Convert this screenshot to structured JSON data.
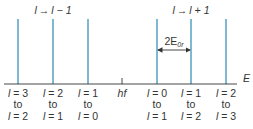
{
  "diagram": {
    "axis_label": "E",
    "center_label": "hf",
    "spacing_label": "2E",
    "spacing_label_sub": "0r",
    "group_left": {
      "l": "l",
      "arrow": "→",
      "target": "l − 1"
    },
    "group_right": {
      "l": "l",
      "arrow": "→",
      "target": "l + 1"
    },
    "line_color": "#7dbad2",
    "lines": [
      {
        "from": "l = 3",
        "to_word": "to",
        "to": "l = 2"
      },
      {
        "from": "l = 2",
        "to_word": "to",
        "to": "l = 1"
      },
      {
        "from": "l = 1",
        "to_word": "to",
        "to": "l = 0"
      },
      {
        "from": "l = 0",
        "to_word": "to",
        "to": "l = 1"
      },
      {
        "from": "l = 1",
        "to_word": "to",
        "to": "l = 2"
      },
      {
        "from": "l = 2",
        "to_word": "to",
        "to": "l = 3"
      }
    ]
  }
}
